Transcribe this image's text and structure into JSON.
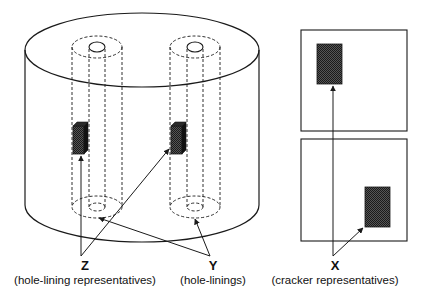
{
  "diagram": {
    "type": "schematic",
    "colors": {
      "stroke": "#1a1a1a",
      "fill_pattern": "#3a3a3a",
      "background": "#ffffff"
    },
    "labels": {
      "z": {
        "letter": "Z",
        "desc": "(hole-lining representatives)"
      },
      "y": {
        "letter": "Y",
        "desc": "(hole-linings)"
      },
      "x": {
        "letter": "X",
        "desc": "(cracker representatives)"
      }
    },
    "components": {
      "cylinder": "outer cylinder",
      "hole_linings": [
        "hole-lining 1",
        "hole-lining 2"
      ],
      "hole_lining_representatives": [
        "representative 1",
        "representative 2"
      ],
      "cracker_plates": [
        "cracker plate top",
        "cracker plate bottom"
      ],
      "cracker_representatives": [
        "representative top",
        "representative bottom"
      ]
    }
  }
}
